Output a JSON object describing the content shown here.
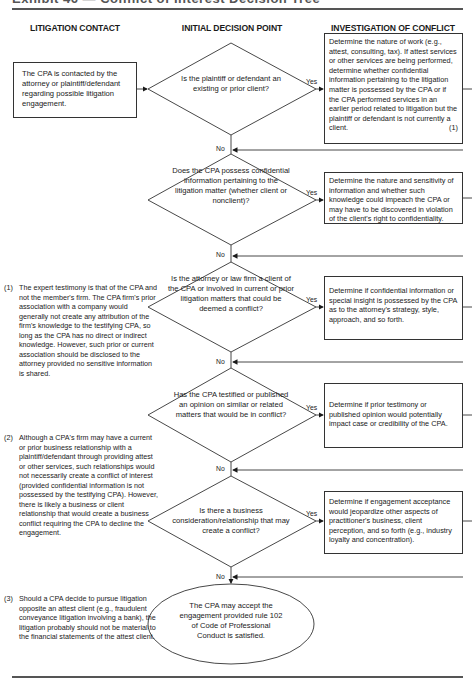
{
  "title": "Exhibit 46 — Conflict of Interest Decision Tree",
  "columns": {
    "left": "LITIGATION CONTACT",
    "middle": "INITIAL DECISION POINT",
    "right": "INVESTIGATION OF CONFLICT"
  },
  "start_box": "The CPA is contacted by the attorney or plaintiff/defendant regarding possible litigation engagement.",
  "labels": {
    "yes": "Yes",
    "no": "No"
  },
  "decisions": [
    {
      "question": "Is the plaintiff or defendant an existing or prior client?",
      "investigation": "Determine the nature of work (e.g., attest, consulting, tax). If attest services or other services are being performed, determine whether confidential information pertaining to the litigation matter is possessed by the CPA or if the CPA performed services in an earlier period related to litigation but the plaintiff or defendant is not currently a client.",
      "ref": "(1)"
    },
    {
      "question": "Does the CPA possess confidential information pertaining to the litigation matter (whether client or nonclient)?",
      "investigation": "Determine the nature and sensitivity of information and whether such knowledge could impeach the CPA or may have to be discovered in violation of the client's right to confidentiality.",
      "ref": ""
    },
    {
      "question": "Is the attorney or law firm a client of the CPA or involved in current or prior litigation matters that could be deemed a conflict?",
      "investigation": "Determine if confidential information or special insight is possessed by the CPA as to the attorney's strategy, style, approach, and so forth.",
      "ref": ""
    },
    {
      "question": "Has the CPA testified or published an opinion on similar or related matters that would be in conflict?",
      "investigation": "Determine if prior testimony or published opinion would potentially impact case or credibility of the CPA.",
      "ref": ""
    },
    {
      "question": "Is there a business consideration/relationship that may create a conflict?",
      "investigation": "Determine if engagement acceptance would jeopardize other aspects of practitioner's business, client perception, and so forth (e.g., industry loyalty and concentration).",
      "ref": ""
    }
  ],
  "terminal": "The CPA may accept the engagement provided rule 102 of Code of Professional Conduct is satisfied.",
  "notes": [
    {
      "num": "(1)",
      "text": "The expert testimony is that of the CPA and not the member's firm. The CPA firm's prior association with a company would generally not create any attribution of the firm's knowledge to the testifying CPA, so long as the CPA has no direct or indirect knowledge. However, such prior or current association should be disclosed to the attorney provided no sensitive information is shared."
    },
    {
      "num": "(2)",
      "text": "Although a CPA's firm may have a current or prior business relationship with a plaintiff/defendant through providing attest or other services, such relationships would not necessarily create a conflict of interest (provided confidential information is not possessed by the testifying CPA). However, there is likely a business or client relationship that would create a business conflict requiring the CPA to decline the engagement."
    },
    {
      "num": "(3)",
      "text": "Should a CPA decide to pursue litigation opposite an attest client (e.g., fraudulent conveyance litigation involving a bank), the litigation probably should not be material to the financial statements of the attest client."
    }
  ]
}
